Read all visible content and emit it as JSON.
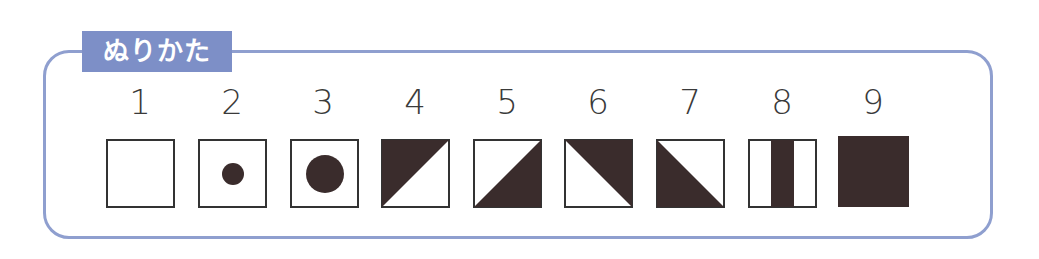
{
  "legend": {
    "title": "ぬりかた",
    "colors": {
      "frame": "#8f9fcf",
      "label_bg": "#7d8fc7",
      "fill": "#3a2c2c",
      "stroke": "#333333"
    },
    "items": [
      {
        "number": "1",
        "pattern": "empty"
      },
      {
        "number": "2",
        "pattern": "small-dot"
      },
      {
        "number": "3",
        "pattern": "large-dot"
      },
      {
        "number": "4",
        "pattern": "top-left-triangle"
      },
      {
        "number": "5",
        "pattern": "bottom-right-triangle"
      },
      {
        "number": "6",
        "pattern": "top-right-triangle"
      },
      {
        "number": "7",
        "pattern": "bottom-left-triangle"
      },
      {
        "number": "8",
        "pattern": "center-vertical-stripe"
      },
      {
        "number": "9",
        "pattern": "full-fill"
      }
    ]
  }
}
